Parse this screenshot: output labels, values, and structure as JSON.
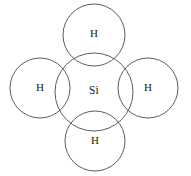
{
  "figure": {
    "type": "chemical-structure-diagram",
    "width": 191,
    "height": 176,
    "background_color": "#ffffff",
    "stroke_color": "#5d5d5d",
    "label_color": "#1a1a1a",
    "stroke_width": 1
  },
  "chart_data": {
    "type": "diagram",
    "xlabel": "",
    "ylabel": "",
    "xlim": [
      0,
      191
    ],
    "ylim": [
      0,
      176
    ],
    "grid": false,
    "legend": "none",
    "nodes": [
      {
        "id": "si-center",
        "label": "Si",
        "element": "Si",
        "role": "central-atom",
        "cx": 94,
        "cy": 92,
        "r": 39,
        "label_x": 94,
        "label_y": 91
      },
      {
        "id": "h-top",
        "label": "H",
        "element": "H",
        "role": "bonded-atom",
        "position": "top",
        "cx": 94,
        "cy": 35,
        "r": 31,
        "label_x": 94,
        "label_y": 34
      },
      {
        "id": "h-left",
        "label": "H",
        "element": "H",
        "role": "bonded-atom",
        "position": "left",
        "cx": 40,
        "cy": 88,
        "r": 30,
        "label_x": 40,
        "label_y": 88
      },
      {
        "id": "h-right",
        "label": "H",
        "element": "H",
        "role": "bonded-atom",
        "position": "right",
        "cx": 148,
        "cy": 88,
        "r": 30,
        "label_x": 148,
        "label_y": 88
      },
      {
        "id": "h-bottom",
        "label": "H",
        "element": "H",
        "role": "bonded-atom",
        "position": "bottom",
        "cx": 95,
        "cy": 141,
        "r": 30,
        "label_x": 95,
        "label_y": 141
      }
    ],
    "bonds": [
      {
        "from": "si-center",
        "to": "h-top",
        "kind": "shell-overlap"
      },
      {
        "from": "si-center",
        "to": "h-left",
        "kind": "shell-overlap"
      },
      {
        "from": "si-center",
        "to": "h-right",
        "kind": "shell-overlap"
      },
      {
        "from": "si-center",
        "to": "h-bottom",
        "kind": "shell-overlap"
      }
    ]
  }
}
